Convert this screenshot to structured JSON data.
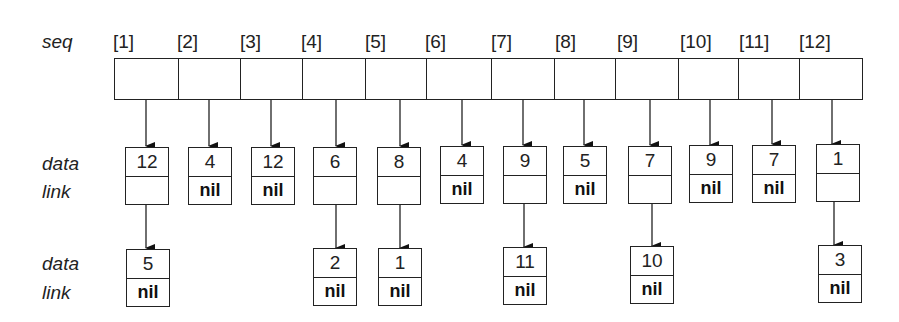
{
  "labels": {
    "seq": "seq",
    "row1_data": "data",
    "row1_link": "link",
    "row2_data": "data",
    "row2_link": "link"
  },
  "seq": {
    "indices": [
      "[1]",
      "[2]",
      "[3]",
      "[4]",
      "[5]",
      "[6]",
      "[7]",
      "[8]",
      "[9]",
      "[10]",
      "[11]",
      "[12]"
    ]
  },
  "nodes_row1": [
    {
      "data": "12",
      "link": ""
    },
    {
      "data": "4",
      "link": "nil"
    },
    {
      "data": "12",
      "link": "nil"
    },
    {
      "data": "6",
      "link": ""
    },
    {
      "data": "8",
      "link": ""
    },
    {
      "data": "4",
      "link": "nil"
    },
    {
      "data": "9",
      "link": ""
    },
    {
      "data": "5",
      "link": "nil"
    },
    {
      "data": "7",
      "link": ""
    },
    {
      "data": "9",
      "link": "nil"
    },
    {
      "data": "7",
      "link": "nil"
    },
    {
      "data": "1",
      "link": ""
    }
  ],
  "nodes_row2": [
    {
      "column": 1,
      "data": "5",
      "link": "nil"
    },
    {
      "column": 4,
      "data": "2",
      "link": "nil"
    },
    {
      "column": 5,
      "data": "1",
      "link": "nil"
    },
    {
      "column": 7,
      "data": "11",
      "link": "nil"
    },
    {
      "column": 9,
      "data": "10",
      "link": "nil"
    },
    {
      "column": 12,
      "data": "3",
      "link": "nil"
    }
  ]
}
